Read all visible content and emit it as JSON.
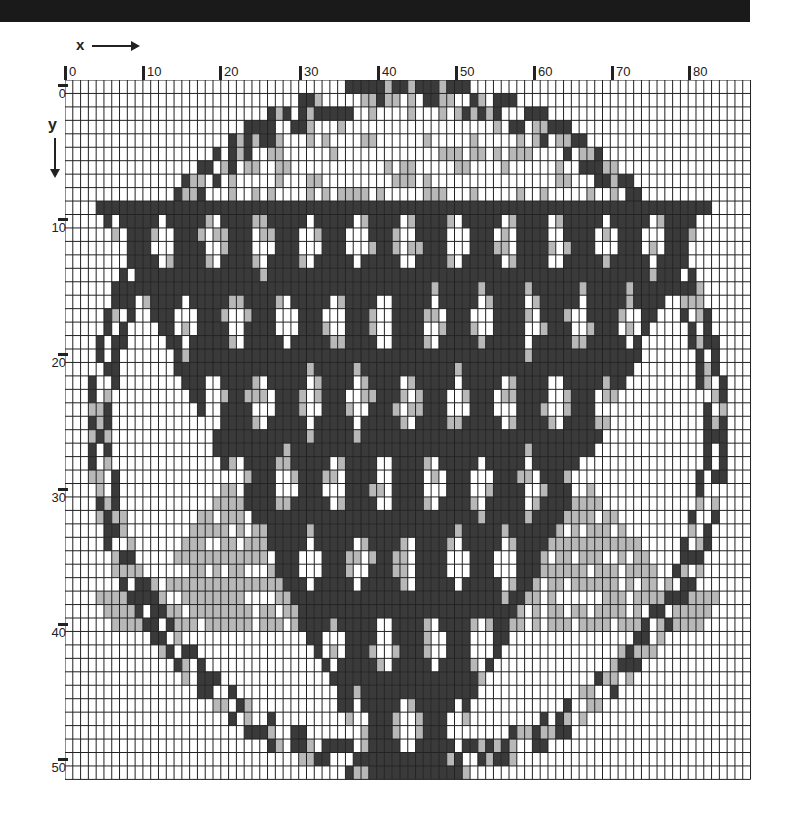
{
  "axes": {
    "x_label": "x",
    "y_label": "y",
    "x_ticks": [
      {
        "label": "0",
        "px": 64
      },
      {
        "label": "10",
        "px": 142
      },
      {
        "label": "20",
        "px": 219
      },
      {
        "label": "30",
        "px": 299
      },
      {
        "label": "40",
        "px": 377
      },
      {
        "label": "50",
        "px": 455
      },
      {
        "label": "60",
        "px": 533
      },
      {
        "label": "70",
        "px": 611
      },
      {
        "label": "80",
        "px": 688
      }
    ],
    "y_ticks": [
      {
        "label": "0",
        "px": 88
      },
      {
        "label": "10",
        "px": 222
      },
      {
        "label": "20",
        "px": 357
      },
      {
        "label": "30",
        "px": 492
      },
      {
        "label": "40",
        "px": 627
      },
      {
        "label": "50",
        "px": 762
      }
    ]
  },
  "grid": {
    "cols": 88,
    "rows": 52,
    "cell_w": 7.79,
    "cell_h": 13.45,
    "colors": {
      "white": "#ffffff",
      "light": "#b8b8b8",
      "dark": "#3a3a3a",
      "line": "#222222"
    }
  },
  "design": {
    "subject": "hot air balloon in circular frame (needlepoint chart)",
    "ring": {
      "cx": 44,
      "cy": 26,
      "rx": 41,
      "ry": 26,
      "thickness": 3.2
    },
    "balloon_triangle": {
      "top_y": 9,
      "top_left_x": 4,
      "top_right_x": 83,
      "apex_x": 44,
      "apex_y": 52
    },
    "top_band": {
      "y": 9,
      "height": 1.5
    },
    "diamond_rows": [
      12,
      18,
      24,
      30,
      36,
      42,
      48
    ],
    "diamond_spacing_x": 6.3,
    "mountains": [
      {
        "cx": 22,
        "peak_y": 30,
        "base_y": 41,
        "halfwidth": 16
      },
      {
        "cx": 66,
        "peak_y": 30,
        "base_y": 41,
        "halfwidth": 16
      }
    ]
  }
}
